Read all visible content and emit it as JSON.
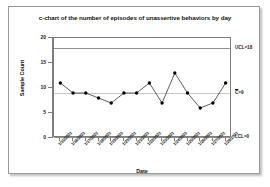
{
  "chart_data": {
    "type": "line",
    "title": "c-chart of the number of episodes of unassertive behaviors by day",
    "xlabel": "Date",
    "ylabel": "Sample Count",
    "ylim": [
      0,
      20
    ],
    "yticks": [
      0,
      5,
      10,
      15,
      20
    ],
    "grid": false,
    "legend": "none",
    "categories": [
      "1/15/2003",
      "1/16/2003",
      "1/17/2003",
      "1/18/2003",
      "1/19/2003",
      "1/20/2003",
      "1/21/2003",
      "1/22/2003",
      "1/23/2003",
      "1/24/2003",
      "1/25/2003",
      "1/26/2003",
      "1/27/2003",
      "1/28/2003"
    ],
    "values": [
      11,
      9,
      9,
      8,
      7,
      9,
      9,
      11,
      7,
      13,
      9,
      6,
      7,
      11
    ],
    "series": [
      {
        "name": "Sample Count",
        "values": [
          11,
          9,
          9,
          8,
          7,
          9,
          9,
          11,
          7,
          13,
          9,
          6,
          7,
          11
        ]
      }
    ],
    "control_limits": {
      "ucl": 18,
      "center": 9,
      "lcl": 0
    },
    "annotations": [
      {
        "id": "ucl",
        "text": "UCL=18",
        "value": 18
      },
      {
        "id": "center",
        "prefix": "C",
        "text": "=9",
        "value": 9
      },
      {
        "id": "lcl",
        "text": "LCL=0",
        "value": 0
      }
    ],
    "colors": {
      "marker": "#000000",
      "line": "#1a1a1a",
      "limit_line": "#8f8f8f",
      "center_line": "#c9c9c9",
      "axis": "#7d7d7d",
      "frame": "#9a9a9a",
      "background": "#ffffff"
    }
  }
}
